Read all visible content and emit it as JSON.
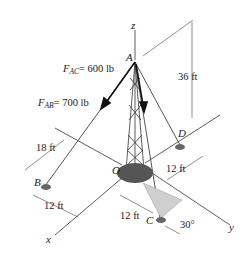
{
  "diagram": {
    "type": "3d-statics-tower",
    "axes": {
      "x": "x",
      "y": "y",
      "z": "z"
    },
    "points": {
      "A": "A",
      "B": "B",
      "C": "C",
      "D": "D",
      "O": "O"
    },
    "forces": {
      "FAC": {
        "symbol": "F",
        "sub": "AC",
        "value": "= 600 lb"
      },
      "FAB": {
        "symbol": "F",
        "sub": "AB",
        "value": "= 700 lb"
      }
    },
    "dimensions": {
      "height": "36 ft",
      "B_x": "18 ft",
      "B_y": "12 ft",
      "D_y": "12 ft",
      "C_dist": "12 ft",
      "C_angle": "30°"
    },
    "colors": {
      "line": "#333333",
      "force": "#111111",
      "shade": "#cfcfcf",
      "base": "#555555"
    }
  }
}
